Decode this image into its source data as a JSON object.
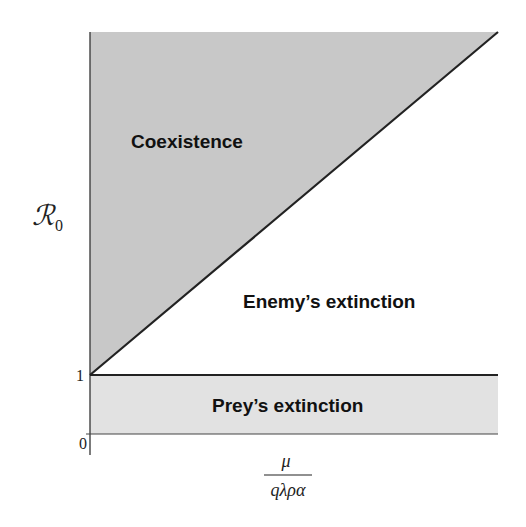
{
  "diagram": {
    "type": "phase-diagram",
    "regions": [
      {
        "name": "coexistence",
        "label": "Coexistence",
        "fill": "#c8c8c8"
      },
      {
        "name": "enemy-extinction",
        "label": "Enemy’s extinction",
        "fill": "#ffffff"
      },
      {
        "name": "prey-extinction",
        "label": "Prey’s extinction",
        "fill": "#e2e2e2"
      }
    ],
    "y_axis": {
      "label_symbol": "ℛ",
      "label_subscript": "0",
      "ticks": [
        {
          "value": "1"
        },
        {
          "value": "0"
        }
      ]
    },
    "x_axis": {
      "label_numerator": "μ",
      "label_denominator": "qλρα"
    },
    "colors": {
      "line": "#222222",
      "coexistence_fill": "#c8c8c8",
      "prey_extinction_fill": "#e2e2e2",
      "background": "#ffffff"
    }
  }
}
